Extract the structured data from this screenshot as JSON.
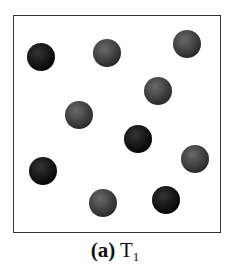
{
  "figure": {
    "label": "(a)",
    "temperature_symbol": "T",
    "temperature_subscript": "1",
    "colors": {
      "dark_particle": "#111111",
      "gray_particle": "#4a4a4a",
      "border": "#333333"
    },
    "particles": [
      {
        "type": "dark",
        "cx": 41,
        "cy": 57
      },
      {
        "type": "gray",
        "cx": 107,
        "cy": 53
      },
      {
        "type": "gray",
        "cx": 187,
        "cy": 44
      },
      {
        "type": "gray",
        "cx": 158,
        "cy": 91
      },
      {
        "type": "gray",
        "cx": 79,
        "cy": 115
      },
      {
        "type": "dark",
        "cx": 138,
        "cy": 139
      },
      {
        "type": "gray",
        "cx": 195,
        "cy": 159
      },
      {
        "type": "dark",
        "cx": 43,
        "cy": 171
      },
      {
        "type": "gray",
        "cx": 103,
        "cy": 203
      },
      {
        "type": "dark",
        "cx": 166,
        "cy": 200
      }
    ]
  }
}
